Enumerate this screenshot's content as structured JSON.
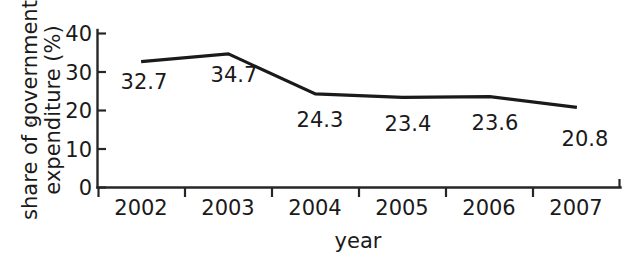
{
  "chart_data": {
    "type": "line",
    "title": "",
    "subtitle": "",
    "xlabel": "year",
    "ylabel": "share of government expenditure (%)",
    "ylabel_line1": "share of government",
    "ylabel_line2": "expenditure (%)",
    "categories": [
      "2002",
      "2003",
      "2004",
      "2005",
      "2006",
      "2007"
    ],
    "values": [
      32.7,
      34.7,
      24.3,
      23.4,
      23.6,
      20.8
    ],
    "point_labels": [
      "32.7",
      "34.7",
      "24.3",
      "23.4",
      "23.6",
      "20.8"
    ],
    "ytick_labels": [
      "0",
      "10",
      "20",
      "30",
      "40"
    ],
    "ytick_values": [
      0,
      10,
      20,
      30,
      40
    ],
    "ylim": [
      0,
      40
    ],
    "xlim_categories": 6,
    "grid": false,
    "legend": false,
    "legend_position": "none",
    "series": [
      {
        "name": "share of government expenditure (%)",
        "values": [
          32.7,
          34.7,
          24.3,
          23.4,
          23.6,
          20.8
        ],
        "color": "#1a1a1a"
      }
    ],
    "line_color": "#1a1a1a",
    "axis_color": "#262626",
    "background_color": "#ffffff"
  }
}
